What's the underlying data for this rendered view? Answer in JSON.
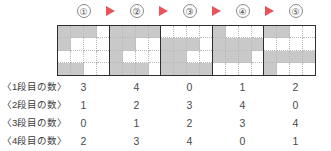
{
  "steps": [
    {
      "label": "①",
      "name": "step-1"
    },
    {
      "label": "②",
      "name": "step-2"
    },
    {
      "label": "③",
      "name": "step-3"
    },
    {
      "label": "④",
      "name": "step-4"
    },
    {
      "label": "⑤",
      "name": "step-5"
    }
  ],
  "arrow_icon": "play-triangle-right-icon",
  "colors": {
    "arrow": "#e8545a",
    "filled_cell": "#c9c9c9",
    "empty_cell": "#ffffff",
    "block_border": "#2e2e2e",
    "inner_grid": "#b9b9b9",
    "text": "#3b3b3b"
  },
  "grid": {
    "columns": 4,
    "rows": 4,
    "blocks": [
      {
        "step": "①",
        "row_counts": [
          3,
          1,
          0,
          2
        ]
      },
      {
        "step": "②",
        "row_counts": [
          4,
          2,
          1,
          3
        ]
      },
      {
        "step": "③",
        "row_counts": [
          0,
          3,
          2,
          4
        ]
      },
      {
        "step": "④",
        "row_counts": [
          1,
          4,
          3,
          0
        ]
      },
      {
        "step": "⑤",
        "row_counts": [
          2,
          0,
          4,
          1
        ]
      }
    ]
  },
  "counts_table": {
    "rows": [
      {
        "label": "〈1段目の数〉",
        "values": [
          "3",
          "4",
          "0",
          "1",
          "2"
        ]
      },
      {
        "label": "〈2段目の数〉",
        "values": [
          "1",
          "2",
          "3",
          "4",
          "0"
        ]
      },
      {
        "label": "〈3段目の数〉",
        "values": [
          "0",
          "1",
          "2",
          "3",
          "4"
        ]
      },
      {
        "label": "〈4段目の数〉",
        "values": [
          "2",
          "3",
          "4",
          "0",
          "1"
        ]
      }
    ]
  }
}
